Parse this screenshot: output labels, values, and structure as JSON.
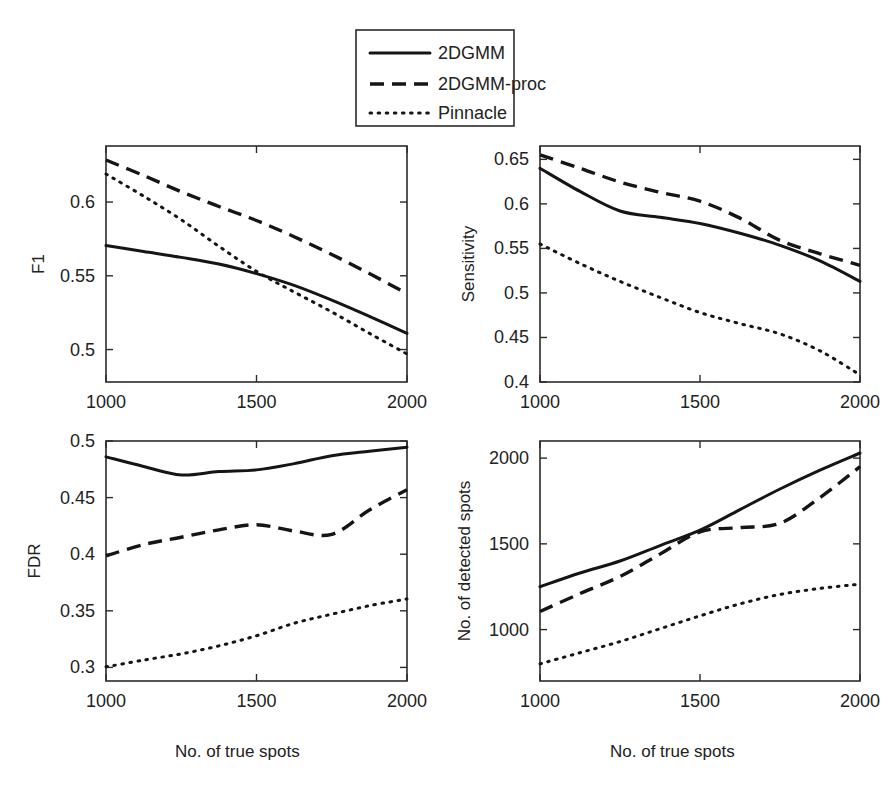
{
  "figure": {
    "legend": {
      "position": "top-center",
      "entries": [
        {
          "label": "2DGMM",
          "style": "solid"
        },
        {
          "label": "2DGMM-proc",
          "style": "dashed"
        },
        {
          "label": "Pinnacle",
          "style": "dotted"
        }
      ]
    },
    "shared_xlabel": "No. of true spots",
    "x_ticks": [
      "1000",
      "1500",
      "2000"
    ]
  },
  "chart_data": [
    {
      "type": "line",
      "title": "",
      "panel": "top-left",
      "xlabel": "No. of true spots",
      "ylabel": "F1",
      "xlim": [
        1000,
        2000
      ],
      "ylim": [
        0.478,
        0.638
      ],
      "xticks": [
        1000,
        1500,
        2000
      ],
      "xticklabels": [
        "1000",
        "1500",
        "2000"
      ],
      "yticks": [
        0.5,
        0.55,
        0.6
      ],
      "yticklabels": [
        "0.5",
        "0.55",
        "0.6"
      ],
      "grid": false,
      "legend": "shared-top",
      "x": [
        1000,
        1125,
        1250,
        1375,
        1500,
        1625,
        1750,
        1875,
        2000
      ],
      "series": [
        {
          "name": "2DGMM",
          "style": "solid",
          "values": [
            0.5705,
            0.5665,
            0.5625,
            0.558,
            0.5515,
            0.5435,
            0.5335,
            0.5225,
            0.511
          ]
        },
        {
          "name": "2DGMM-proc",
          "style": "dashed",
          "values": [
            0.6285,
            0.618,
            0.607,
            0.597,
            0.5875,
            0.5765,
            0.5645,
            0.5515,
            0.538
          ]
        },
        {
          "name": "Pinnacle",
          "style": "dotted",
          "values": [
            0.619,
            0.604,
            0.588,
            0.57,
            0.553,
            0.539,
            0.5255,
            0.511,
            0.497
          ]
        }
      ]
    },
    {
      "type": "line",
      "title": "",
      "panel": "top-right",
      "xlabel": "No. of true spots",
      "ylabel": "Sensitivity",
      "xlim": [
        1000,
        2000
      ],
      "ylim": [
        0.4,
        0.665
      ],
      "xticks": [
        1000,
        1500,
        2000
      ],
      "xticklabels": [
        "1000",
        "1500",
        "2000"
      ],
      "yticks": [
        0.4,
        0.45,
        0.5,
        0.55,
        0.6,
        0.65
      ],
      "yticklabels": [
        "0.4",
        "0.45",
        "0.5",
        "0.55",
        "0.6",
        "0.65"
      ],
      "grid": false,
      "legend": "shared-top",
      "x": [
        1000,
        1125,
        1250,
        1375,
        1500,
        1625,
        1750,
        1875,
        2000
      ],
      "series": [
        {
          "name": "2DGMM",
          "style": "solid",
          "values": [
            0.64,
            0.614,
            0.592,
            0.585,
            0.578,
            0.567,
            0.5535,
            0.536,
            0.513
          ]
        },
        {
          "name": "2DGMM-proc",
          "style": "dashed",
          "values": [
            0.655,
            0.64,
            0.6245,
            0.613,
            0.603,
            0.584,
            0.559,
            0.544,
            0.531
          ]
        },
        {
          "name": "Pinnacle",
          "style": "dotted",
          "values": [
            0.555,
            0.533,
            0.513,
            0.495,
            0.478,
            0.4655,
            0.454,
            0.435,
            0.408
          ]
        }
      ]
    },
    {
      "type": "line",
      "title": "",
      "panel": "bottom-left",
      "xlabel": "No. of true spots",
      "ylabel": "FDR",
      "xlim": [
        1000,
        2000
      ],
      "ylim": [
        0.288,
        0.5
      ],
      "xticks": [
        1000,
        1500,
        2000
      ],
      "xticklabels": [
        "1000",
        "1500",
        "2000"
      ],
      "yticks": [
        0.3,
        0.35,
        0.4,
        0.45,
        0.5
      ],
      "yticklabels": [
        "0.3",
        "0.35",
        "0.4",
        "0.45",
        "0.5"
      ],
      "grid": false,
      "legend": "shared-top",
      "x": [
        1000,
        1125,
        1250,
        1375,
        1500,
        1625,
        1750,
        1875,
        2000
      ],
      "series": [
        {
          "name": "2DGMM",
          "style": "solid",
          "values": [
            0.486,
            0.4775,
            0.47,
            0.473,
            0.4745,
            0.48,
            0.487,
            0.491,
            0.4945
          ]
        },
        {
          "name": "2DGMM-proc",
          "style": "dashed",
          "values": [
            0.3985,
            0.4085,
            0.415,
            0.4215,
            0.426,
            0.4205,
            0.4175,
            0.439,
            0.457
          ]
        },
        {
          "name": "Pinnacle",
          "style": "dotted",
          "values": [
            0.3005,
            0.3065,
            0.312,
            0.319,
            0.328,
            0.339,
            0.347,
            0.3545,
            0.3605
          ]
        }
      ]
    },
    {
      "type": "line",
      "title": "",
      "panel": "bottom-right",
      "xlabel": "No. of true spots",
      "ylabel": "No. of detected spots",
      "xlim": [
        1000,
        2000
      ],
      "ylim": [
        700,
        2100
      ],
      "xticks": [
        1000,
        1500,
        2000
      ],
      "xticklabels": [
        "1000",
        "1500",
        "2000"
      ],
      "yticks": [
        1000,
        1500,
        2000
      ],
      "yticklabels": [
        "1000",
        "1500",
        "2000"
      ],
      "grid": false,
      "legend": "shared-top",
      "x": [
        1000,
        1125,
        1250,
        1375,
        1500,
        1625,
        1750,
        1875,
        2000
      ],
      "series": [
        {
          "name": "2DGMM",
          "style": "solid",
          "values": [
            1250,
            1330,
            1400,
            1490,
            1580,
            1700,
            1820,
            1930,
            2030
          ]
        },
        {
          "name": "2DGMM-proc",
          "style": "dashed",
          "values": [
            1105,
            1210,
            1310,
            1440,
            1570,
            1595,
            1620,
            1770,
            1950
          ]
        },
        {
          "name": "Pinnacle",
          "style": "dotted",
          "values": [
            800,
            865,
            930,
            1005,
            1080,
            1150,
            1205,
            1240,
            1265
          ]
        }
      ]
    }
  ]
}
